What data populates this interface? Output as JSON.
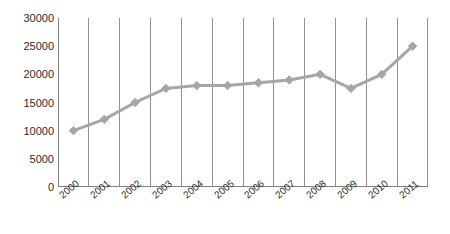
{
  "chart_data": {
    "type": "line",
    "title": "",
    "subtitle": "",
    "xlabel": "",
    "ylabel": "",
    "categories": [
      "2000",
      "2001",
      "2002",
      "2003",
      "2004",
      "2005",
      "2006",
      "2007",
      "2008",
      "2009",
      "2010",
      "2011"
    ],
    "values": [
      10000,
      12000,
      15000,
      17500,
      18000,
      18000,
      18500,
      19000,
      20000,
      17500,
      20000,
      25000
    ],
    "series": [
      {
        "name": "",
        "values": [
          10000,
          12000,
          15000,
          17500,
          18000,
          18000,
          18500,
          19000,
          20000,
          17500,
          20000,
          25000
        ]
      }
    ],
    "ylim": [
      0,
      30000
    ],
    "y_ticks": [
      0,
      5000,
      10000,
      15000,
      20000,
      25000,
      30000
    ],
    "y_tick_labels": [
      "0",
      "5000",
      "10000",
      "15000",
      "20000",
      "25000",
      "30000"
    ],
    "grid": "vertical",
    "legend": "none",
    "marker": "diamond",
    "colors": {
      "line": "#a6a6a6",
      "marker": "#a6a6a6",
      "gridline": "#808080",
      "axis": "#808080",
      "text": "#2b2b2b",
      "background": "#ffffff"
    }
  }
}
